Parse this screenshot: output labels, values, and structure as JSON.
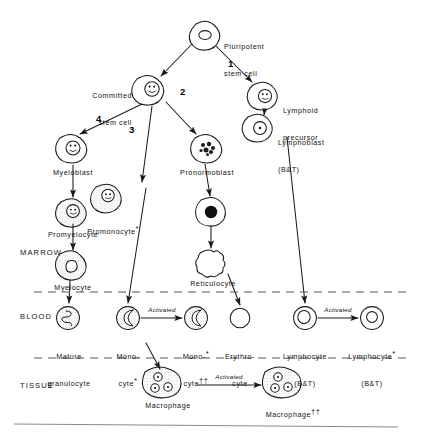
{
  "zones": {
    "marrow": "MARROW",
    "blood": "BLOOD",
    "tissue": "TISSUE"
  },
  "pathway_numbers": {
    "one": "1",
    "two": "2",
    "three": "3",
    "four": "4"
  },
  "cells": {
    "pluripotent": "Pluripotent\nstem cell",
    "pluripotent_l1": "Pluripotent",
    "pluripotent_l2": "stem cell",
    "committed_l1": "Committed",
    "committed_l2": "stem cell",
    "lymphoid_l1": "Lymphoid",
    "lymphoid_l2": "precursor",
    "lymphoblast_l1": "Lymphoblast",
    "lymphoblast_l2": "(B&T)",
    "myeloblast": "Myeloblast",
    "promonocyte": "Promonocyte",
    "promonocyte_sup": "*",
    "pronormoblast": "Pronormoblast",
    "promyelocyte": "Promyelocyte",
    "myelocyte": "Myelocyte",
    "reticulocyte": "Reticulocyte",
    "mature_granulocyte_l1": "Mature",
    "mature_granulocyte_l2": "granulocyte",
    "monocyte_l1": "Mono-",
    "monocyte_l2": "cyte",
    "monocyte_sup": "*",
    "monocyte_activated_l1": "Mono-",
    "monocyte_activated_l1_sup": "*",
    "monocyte_activated_l2": "cyte",
    "monocyte_activated_sup": "††",
    "erythrocyte_l1": "Erythro-",
    "erythrocyte_l2": "cyte",
    "lymphocyte_l1": "Lymphocyte",
    "lymphocyte_l2": "(B&T)",
    "lymphocyte_activated_l1": "Lymphocyte",
    "lymphocyte_activated_sup": "*",
    "lymphocyte_activated_l2": "(B&T)",
    "macrophage": "Macrophage",
    "macrophage_activated": "Macrophage",
    "macrophage_activated_sup": "††"
  },
  "arrow_labels": {
    "activated_monocyte": "Activated",
    "activated_lymphocyte": "Activated",
    "activated_macrophage": "Activated"
  },
  "colors": {
    "ink": "#1a1a1a",
    "stipple": "#9a9a9a",
    "rule": "#8a8a8a",
    "dash": "#555555",
    "nucleus_dark": "#111111"
  }
}
